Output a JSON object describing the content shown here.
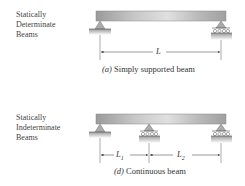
{
  "panels": [
    {
      "category_line1": "Statically",
      "category_line2": "Determinate",
      "category_line3": "Beams",
      "caption_letter": "(a)",
      "caption_text": "Simply supported beam",
      "dimensions": [
        "L"
      ]
    },
    {
      "category_line1": "Statically",
      "category_line2": "Indeterminate",
      "category_line3": "Beams",
      "caption_letter": "(d)",
      "caption_text": "Continuous beam",
      "dimensions": [
        "L1",
        "L2"
      ]
    }
  ]
}
